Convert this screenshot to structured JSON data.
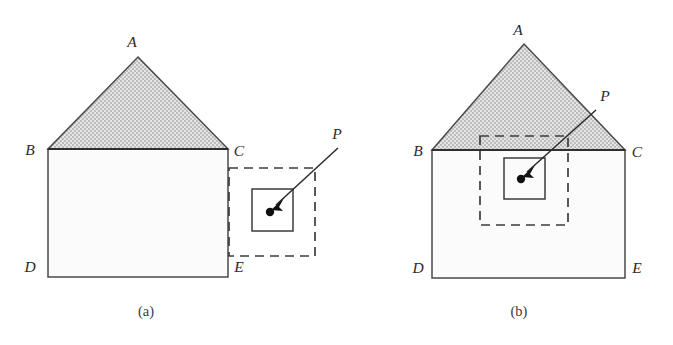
{
  "figure": {
    "type": "geometric-diagram",
    "background_color": "#ffffff",
    "stroke_color": "#3c3c3c",
    "roof_fill_color": "#d4d4d4",
    "wall_fill_color": "#fbfbfb",
    "point_color": "#111111"
  },
  "panels": [
    {
      "id": "a",
      "caption": "(a)",
      "caption_pos": {
        "x": 146,
        "y": 316
      },
      "house": {
        "apex": {
          "label": "A",
          "x": 138,
          "y": 57,
          "label_x": 132,
          "label_y": 47
        },
        "eave_left": {
          "label": "B",
          "x": 48,
          "y": 149,
          "label_x": 30,
          "label_y": 155
        },
        "eave_right": {
          "label": "C",
          "x": 228,
          "y": 149,
          "label_x": 233,
          "label_y": 156
        },
        "base_left": {
          "label": "D",
          "x": 48,
          "y": 277,
          "label_x": 30,
          "label_y": 272
        },
        "base_right": {
          "label": "E",
          "x": 228,
          "y": 277,
          "label_x": 233,
          "label_y": 272
        }
      },
      "dashed_box": {
        "x": 229,
        "y": 168,
        "width": 86,
        "height": 88
      },
      "solid_box": {
        "x": 252,
        "y": 189,
        "width": 41,
        "height": 42
      },
      "point": {
        "label": "P",
        "x": 270,
        "y": 212,
        "label_x": 331,
        "label_y": 139,
        "leader_start_x": 338,
        "leader_start_y": 148
      }
    },
    {
      "id": "b",
      "caption": "(b)",
      "caption_pos": {
        "x": 519,
        "y": 316
      },
      "house": {
        "apex": {
          "label": "A",
          "x": 524,
          "y": 44,
          "label_x": 518,
          "label_y": 35
        },
        "eave_left": {
          "label": "B",
          "x": 432,
          "y": 150,
          "label_x": 414,
          "label_y": 156
        },
        "eave_right": {
          "label": "C",
          "x": 625,
          "y": 150,
          "label_x": 631,
          "label_y": 157
        },
        "base_left": {
          "label": "D",
          "x": 432,
          "y": 278,
          "label_x": 414,
          "label_y": 273
        },
        "base_right": {
          "label": "E",
          "x": 625,
          "y": 278,
          "label_x": 631,
          "label_y": 273
        }
      },
      "dashed_box": {
        "x": 480,
        "y": 136,
        "width": 88,
        "height": 89
      },
      "solid_box": {
        "x": 504,
        "y": 158,
        "width": 41,
        "height": 41
      },
      "point": {
        "label": "P",
        "x": 521,
        "y": 179,
        "label_x": 600,
        "label_y": 101,
        "leader_start_x": 596,
        "leader_start_y": 110
      }
    }
  ]
}
